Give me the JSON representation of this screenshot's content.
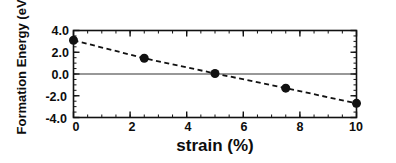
{
  "chart_data": {
    "type": "scatter",
    "title": "",
    "xlabel": "strain (%)",
    "ylabel": "Formation Energy (eV)",
    "xlim": [
      0,
      10
    ],
    "ylim": [
      -4.0,
      4.0
    ],
    "xticks": [
      "0",
      "2",
      "4",
      "6",
      "8",
      "10"
    ],
    "xtick_values": [
      0,
      2,
      4,
      6,
      8,
      10
    ],
    "yticks": [
      "4.0",
      "2.0",
      "0.0",
      "-2.0",
      "-4.0"
    ],
    "ytick_values": [
      4.0,
      2.0,
      0.0,
      -2.0,
      -4.0
    ],
    "x_minor_tick_interval": 0.5,
    "y_minor_tick_interval": 0.5,
    "grid": false,
    "legend": null,
    "series": [
      {
        "name": "Formation energy vs strain",
        "marker": "filled-circle",
        "marker_color": "#111111",
        "marker_size": 9,
        "line_style": "dashed",
        "line_color": "#111111",
        "x": [
          0,
          2.5,
          5,
          7.5,
          10
        ],
        "values": [
          3.1,
          1.45,
          0.05,
          -1.3,
          -2.7
        ]
      }
    ],
    "reference_lines": [
      {
        "name": "zero-energy-line",
        "orientation": "horizontal",
        "value": 0.0,
        "style": "solid",
        "color": "#333333"
      }
    ],
    "frame_color": "#111111",
    "background_color": "#ffffff"
  },
  "axes": {
    "y_title": "Formation Energy (eV)",
    "x_title": "strain (%)"
  }
}
